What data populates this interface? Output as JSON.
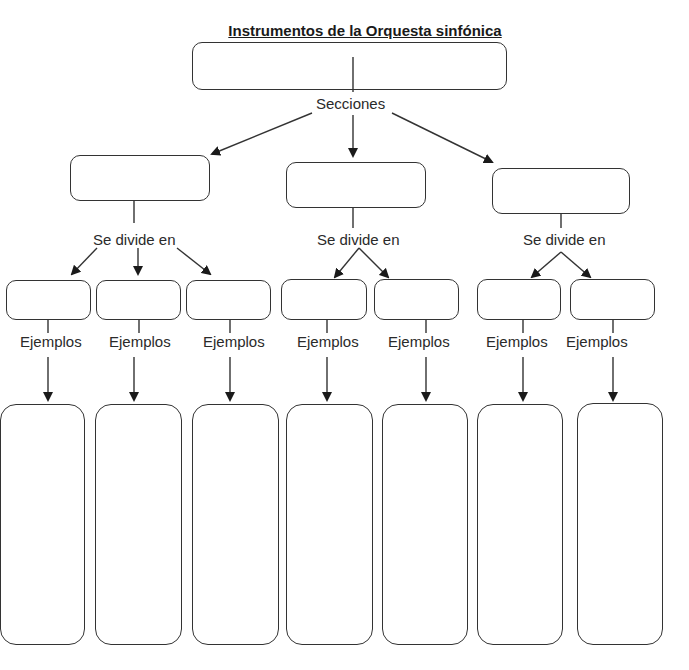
{
  "title": "Instrumentos de la Orquesta sinfónica",
  "labels": {
    "secciones": "Secciones",
    "divide_1": "Se divide en",
    "divide_2": "Se divide en",
    "divide_3": "Se divide en",
    "ejemplos": [
      "Ejemplos",
      "Ejemplos",
      "Ejemplos",
      "Ejemplos",
      "Ejemplos",
      "Ejemplos",
      "Ejemplos"
    ]
  },
  "boxes": {
    "root": "",
    "sections": [
      "",
      "",
      ""
    ],
    "subsections": [
      "",
      "",
      "",
      "",
      "",
      "",
      ""
    ],
    "examples": [
      "",
      "",
      "",
      "",
      "",
      "",
      ""
    ]
  },
  "colors": {
    "stroke": "#333333",
    "background": "#ffffff"
  }
}
